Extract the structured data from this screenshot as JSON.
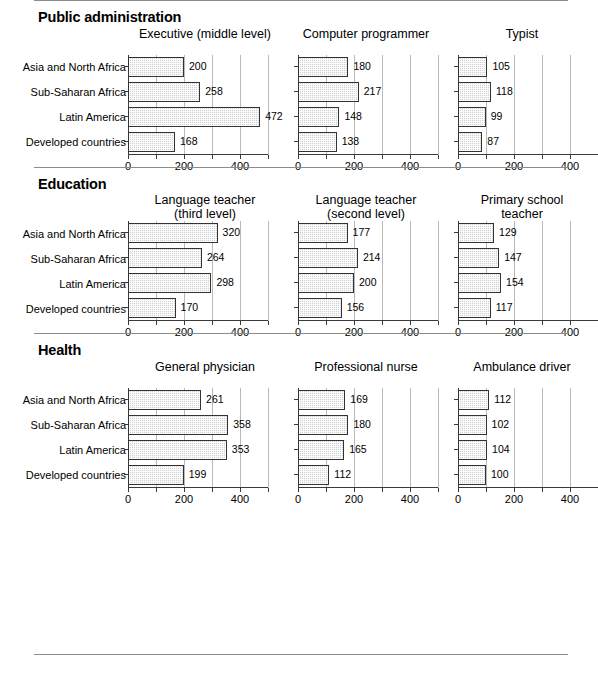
{
  "chart_data": {
    "type": "bar",
    "orientation": "horizontal",
    "title": "",
    "xlabel": "",
    "ylabel": "",
    "xlim": [
      0,
      500
    ],
    "xticks": [
      0,
      100,
      200,
      300,
      400,
      500
    ],
    "xtick_labels": [
      "0",
      "",
      "200",
      "",
      "400",
      ""
    ],
    "grid": true,
    "legend": false,
    "categories": [
      "Asia and North Africa",
      "Sub-Saharan Africa",
      "Latin America",
      "Developed countries"
    ],
    "sections": [
      {
        "name": "Public administration",
        "panels": [
          {
            "title": "Executive (middle level)",
            "title_line1": "Executive (middle level)",
            "title_line2": "",
            "values": [
              200,
              258,
              472,
              168
            ]
          },
          {
            "title": "Computer programmer",
            "title_line1": "Computer programmer",
            "title_line2": "",
            "values": [
              180,
              217,
              148,
              138
            ]
          },
          {
            "title": "Typist",
            "title_line1": "Typist",
            "title_line2": "",
            "values": [
              105,
              118,
              99,
              87
            ]
          }
        ]
      },
      {
        "name": "Education",
        "panels": [
          {
            "title": "Language teacher (third level)",
            "title_line1": "Language teacher",
            "title_line2": "(third level)",
            "values": [
              320,
              264,
              298,
              170
            ]
          },
          {
            "title": "Language teacher (second level)",
            "title_line1": "Language teacher",
            "title_line2": "(second level)",
            "values": [
              177,
              214,
              200,
              156
            ]
          },
          {
            "title": "Primary school teacher",
            "title_line1": "Primary school",
            "title_line2": "teacher",
            "values": [
              129,
              147,
              154,
              117
            ]
          }
        ]
      },
      {
        "name": "Health",
        "panels": [
          {
            "title": "General physician",
            "title_line1": "General physician",
            "title_line2": "",
            "values": [
              261,
              358,
              353,
              199
            ]
          },
          {
            "title": "Professional nurse",
            "title_line1": "Professional nurse",
            "title_line2": "",
            "values": [
              169,
              180,
              165,
              112
            ]
          },
          {
            "title": "Ambulance driver",
            "title_line1": "Ambulance driver",
            "title_line2": "",
            "values": [
              112,
              102,
              104,
              100
            ]
          }
        ]
      }
    ],
    "colors": {
      "bar_fill": "#d2d2d2",
      "bar_border": "#333333",
      "gridline": "#b9b9b9",
      "axis": "#3a3a3a",
      "rule": "#8c8c8c",
      "text": "#000000"
    }
  }
}
